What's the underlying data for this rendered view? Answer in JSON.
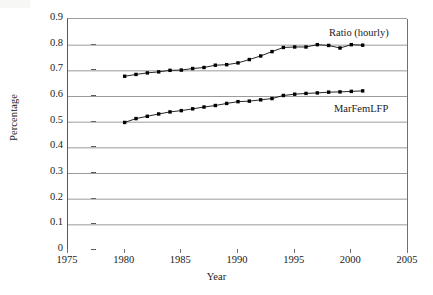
{
  "chart_data": {
    "type": "line",
    "title": "",
    "xlabel": "Year",
    "ylabel": "Percentage",
    "xlim": [
      1975,
      2005
    ],
    "ylim": [
      0,
      0.9
    ],
    "grid": "horizontal",
    "legend_position": "inline-right",
    "x_ticks": [
      1975,
      1980,
      1985,
      1990,
      1995,
      2000,
      2005
    ],
    "x_tick_labels": [
      "1975",
      "1980",
      "1985",
      "1990",
      "1995",
      "2000",
      "2005"
    ],
    "y_ticks": [
      0,
      0.1,
      0.2,
      0.3,
      0.4,
      0.5,
      0.6,
      0.7,
      0.8,
      0.9
    ],
    "y_tick_labels": [
      "0",
      "0.1",
      "0.2",
      "0.3",
      "0.4",
      "0.5",
      "0.6",
      "0.7",
      "0.8",
      "0.9"
    ],
    "x": [
      1980,
      1981,
      1982,
      1983,
      1984,
      1985,
      1986,
      1987,
      1988,
      1989,
      1990,
      1991,
      1992,
      1993,
      1994,
      1995,
      1996,
      1997,
      1998,
      1999,
      2000,
      2001
    ],
    "series": [
      {
        "name": "Ratio (hourly)",
        "marker": "square",
        "color": "#000000",
        "values": [
          0.677,
          0.684,
          0.69,
          0.694,
          0.7,
          0.701,
          0.707,
          0.711,
          0.72,
          0.722,
          0.729,
          0.742,
          0.756,
          0.773,
          0.789,
          0.791,
          0.791,
          0.8,
          0.797,
          0.787,
          0.8,
          0.798
        ]
      },
      {
        "name": "MarFemLFP",
        "marker": "square",
        "color": "#000000",
        "values": [
          0.497,
          0.512,
          0.521,
          0.53,
          0.538,
          0.543,
          0.55,
          0.557,
          0.563,
          0.571,
          0.578,
          0.58,
          0.585,
          0.59,
          0.602,
          0.607,
          0.61,
          0.612,
          0.615,
          0.616,
          0.618,
          0.62
        ]
      }
    ]
  },
  "axes": {
    "y_title": "Percentage",
    "x_title": "Year"
  }
}
